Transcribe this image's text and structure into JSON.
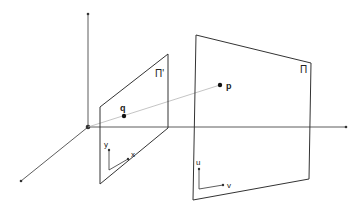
{
  "diagram": {
    "colors": {
      "line": "#333333",
      "ray": "#aaaaaa",
      "background": "#ffffff"
    },
    "labels": {
      "point_p": "p",
      "point_q": "q",
      "plane_big": "Π",
      "plane_small": "Π'",
      "small_axis_x": "x",
      "small_axis_y": "y",
      "big_axis_u": "u",
      "big_axis_v": "v"
    },
    "nodes": [
      {
        "id": "origin",
        "label": "",
        "x": 88,
        "y": 127
      },
      {
        "id": "q",
        "label": "q",
        "x": 124,
        "y": 116
      },
      {
        "id": "p",
        "label": "p",
        "x": 220,
        "y": 85
      }
    ],
    "edges": [
      {
        "from": "origin",
        "to": "p",
        "style": "dashed-light",
        "label": "projection ray"
      }
    ]
  }
}
